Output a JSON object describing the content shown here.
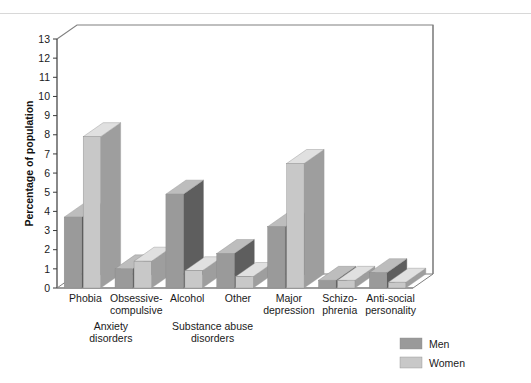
{
  "chart_data": {
    "type": "bar",
    "title": "",
    "xlabel": "",
    "ylabel": "Percentage of population",
    "ylim": [
      0,
      13
    ],
    "ytick_labels": [
      "0",
      "1",
      "2",
      "3",
      "4",
      "5",
      "6",
      "7",
      "8",
      "9",
      "10",
      "11",
      "12",
      "13"
    ],
    "grid": false,
    "legend_position": "bottom-right",
    "categories": [
      "Phobia",
      "Obsessive-compulsive",
      "Alcohol",
      "Other",
      "Major depression",
      "Schizo-phrenia",
      "Anti-social personality"
    ],
    "category_lines": [
      [
        "Phobia"
      ],
      [
        "Obsessive-",
        "compulsive"
      ],
      [
        "Alcohol"
      ],
      [
        "Other"
      ],
      [
        "Major",
        "depression"
      ],
      [
        "Schizo-",
        "phrenia"
      ],
      [
        "Anti-social",
        "personality"
      ]
    ],
    "groups": [
      {
        "label_lines": [
          "Anxiety",
          "disorders"
        ],
        "categories": [
          0,
          1
        ]
      },
      {
        "label_lines": [
          "Substance abuse",
          "disorders"
        ],
        "categories": [
          2,
          3
        ]
      }
    ],
    "series": [
      {
        "name": "Men",
        "color": "#9a9a9a",
        "values": [
          3.7,
          1.0,
          4.9,
          1.8,
          3.2,
          0.4,
          0.8
        ]
      },
      {
        "name": "Women",
        "color": "#c8c8c8",
        "values": [
          7.9,
          1.4,
          0.9,
          0.6,
          6.5,
          0.4,
          0.3
        ]
      }
    ]
  },
  "legend": {
    "entries": [
      {
        "label": "Men",
        "swatch": "#9a9a9a"
      },
      {
        "label": "Women",
        "swatch": "#c8c8c8"
      }
    ]
  },
  "colors": {
    "men_front": "#9a9a9a",
    "men_side": "#5e5e5e",
    "men_top": "#bdbdbd",
    "women_front": "#c8c8c8",
    "women_side": "#9e9e9e",
    "women_top": "#e0e0e0",
    "frame": "#808080",
    "floor": "#d0d0d0",
    "background": "#ffffff"
  }
}
